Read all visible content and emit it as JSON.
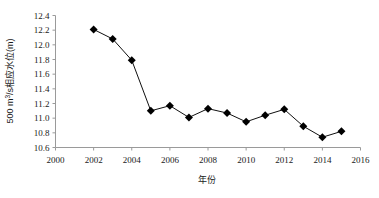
{
  "chart_data": {
    "type": "line",
    "title": "",
    "subtitle": "",
    "xlabel": "年份",
    "ylabel": "500 m³/s相应水位(m)",
    "xlim": [
      2000,
      2016
    ],
    "ylim": [
      10.6,
      12.4
    ],
    "xticks": [
      2000,
      2002,
      2004,
      2006,
      2008,
      2010,
      2012,
      2014,
      2016
    ],
    "xtick_labels": [
      "2000",
      "2002",
      "2004",
      "2006",
      "2008",
      "2010",
      "2012",
      "2014",
      "2016"
    ],
    "yticks": [
      10.6,
      10.8,
      11.0,
      11.2,
      11.4,
      11.6,
      11.8,
      12.0,
      12.2,
      12.4
    ],
    "ytick_labels": [
      "10.6",
      "10.8",
      "11.0",
      "11.2",
      "11.4",
      "11.6",
      "11.8",
      "12.0",
      "12.2",
      "12.4"
    ],
    "grid": false,
    "legend": false,
    "legend_position": "none",
    "marker": "diamond",
    "marker_color": "#000000",
    "line_color": "#101010",
    "x": [
      2002,
      2003,
      2004,
      2005,
      2006,
      2007,
      2008,
      2009,
      2010,
      2011,
      2012,
      2013,
      2014,
      2015
    ],
    "values": [
      12.21,
      12.08,
      11.79,
      11.1,
      11.17,
      11.01,
      11.13,
      11.07,
      10.95,
      11.04,
      11.12,
      10.89,
      10.74,
      10.82
    ],
    "series": [
      {
        "name": "500 m³/s相应水位",
        "x": [
          2002,
          2003,
          2004,
          2005,
          2006,
          2007,
          2008,
          2009,
          2010,
          2011,
          2012,
          2013,
          2014,
          2015
        ],
        "values": [
          12.21,
          12.08,
          11.79,
          11.1,
          11.17,
          11.01,
          11.13,
          11.07,
          10.95,
          11.04,
          11.12,
          10.89,
          10.74,
          10.82
        ]
      }
    ],
    "annotations": []
  },
  "axis": {
    "y_title_prefix": "500 m",
    "y_title_exponent": "3",
    "y_title_suffix": "/s相应水位(m)"
  }
}
